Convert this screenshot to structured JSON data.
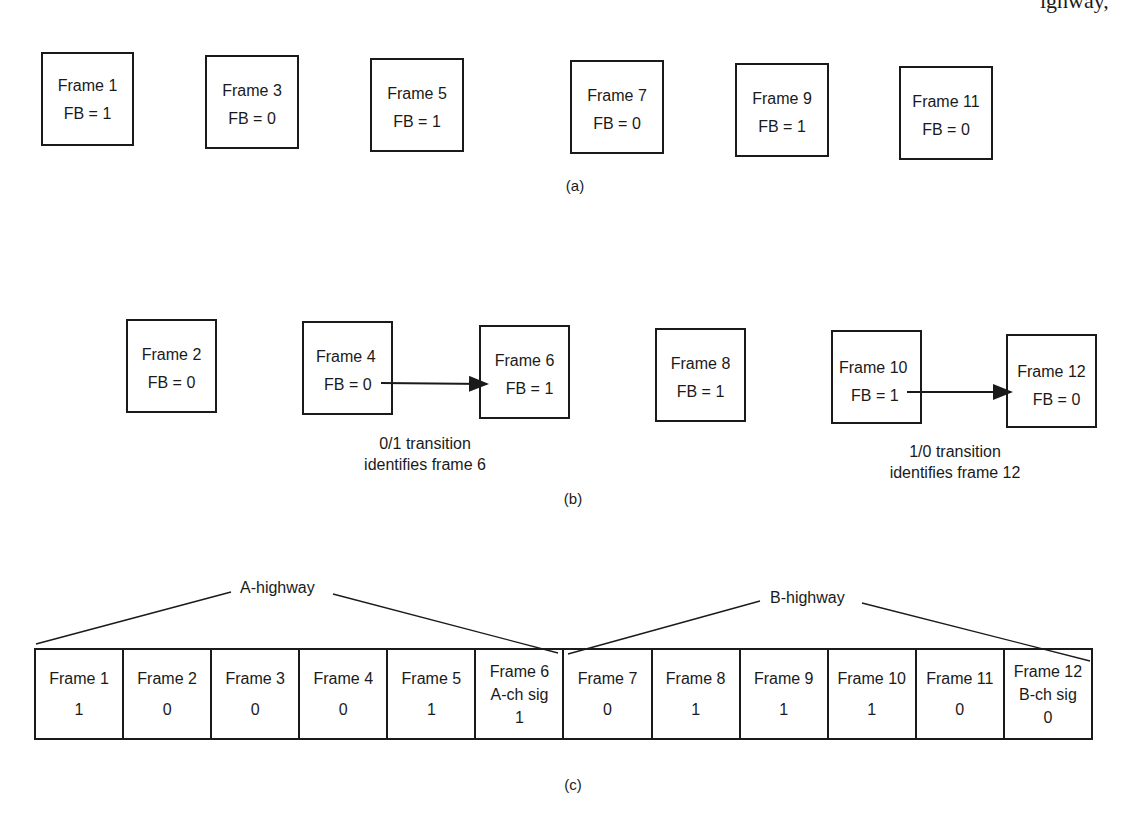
{
  "page_fragment": {
    "top_right_text": "ighway,"
  },
  "part_a": {
    "caption": "(a)",
    "frames": [
      {
        "label": "Frame 1",
        "fb": "FB = 1"
      },
      {
        "label": "Frame 3",
        "fb": "FB = 0"
      },
      {
        "label": "Frame 5",
        "fb": "FB = 1"
      },
      {
        "label": "Frame 7",
        "fb": "FB = 0"
      },
      {
        "label": "Frame 9",
        "fb": "FB = 1"
      },
      {
        "label": "Frame 11",
        "fb": "FB = 0"
      }
    ]
  },
  "part_b": {
    "caption": "(b)",
    "frames": [
      {
        "label": "Frame 2",
        "fb": "FB = 0"
      },
      {
        "label": "Frame 4",
        "fb": "FB = 0"
      },
      {
        "label": "Frame 6",
        "fb": "FB = 1"
      },
      {
        "label": "Frame 8",
        "fb": "FB = 1"
      },
      {
        "label": "Frame 10",
        "fb": "FB = 1"
      },
      {
        "label": "Frame 12",
        "fb": "FB = 0"
      }
    ],
    "transitions": [
      {
        "from": "Frame 4",
        "to": "Frame 6",
        "line1": "0/1 transition",
        "line2": "identifies frame 6"
      },
      {
        "from": "Frame 10",
        "to": "Frame 12",
        "line1": "1/0 transition",
        "line2": "identifies frame 12"
      }
    ]
  },
  "part_c": {
    "caption": "(c)",
    "highways": [
      {
        "label": "A-highway",
        "spans": "Frame 1 - Frame 6"
      },
      {
        "label": "B-highway",
        "spans": "Frame 7 - Frame 12"
      }
    ],
    "cells": [
      {
        "label": "Frame 1",
        "sub": "",
        "value": "1"
      },
      {
        "label": "Frame 2",
        "sub": "",
        "value": "0"
      },
      {
        "label": "Frame 3",
        "sub": "",
        "value": "0"
      },
      {
        "label": "Frame 4",
        "sub": "",
        "value": "0"
      },
      {
        "label": "Frame 5",
        "sub": "",
        "value": "1"
      },
      {
        "label": "Frame 6",
        "sub": "A-ch sig",
        "value": "1"
      },
      {
        "label": "Frame 7",
        "sub": "",
        "value": "0"
      },
      {
        "label": "Frame 8",
        "sub": "",
        "value": "1"
      },
      {
        "label": "Frame 9",
        "sub": "",
        "value": "1"
      },
      {
        "label": "Frame 10",
        "sub": "",
        "value": "1"
      },
      {
        "label": "Frame 11",
        "sub": "",
        "value": "0"
      },
      {
        "label": "Frame 12",
        "sub": "B-ch sig",
        "value": "0"
      }
    ]
  }
}
